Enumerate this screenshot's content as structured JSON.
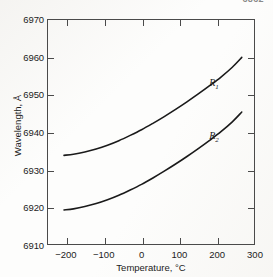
{
  "header": {
    "fragment_text": "6862"
  },
  "chart_data": {
    "type": "line",
    "title": "",
    "xlabel": "Temperature, °C",
    "ylabel": "Wavelength, Å",
    "xlim": [
      -250,
      300
    ],
    "ylim": [
      6910,
      6970
    ],
    "xticks": [
      -200,
      -100,
      0,
      100,
      200,
      300
    ],
    "xtick_labels": [
      "−200",
      "−100",
      "0",
      "100",
      "200",
      "300"
    ],
    "yticks": [
      6910,
      6920,
      6930,
      6940,
      6950,
      6960,
      6970
    ],
    "ytick_labels": [
      "6910",
      "6920",
      "6930",
      "6940",
      "6950",
      "6960",
      "6970"
    ],
    "grid": false,
    "legend": "inline-labels",
    "series": [
      {
        "name": "R1",
        "label": "R",
        "subscript": "1",
        "color": "#1a1a1a",
        "label_x": 200,
        "label_y": 6953,
        "x": [
          -205,
          -180,
          -150,
          -120,
          -90,
          -60,
          -30,
          0,
          30,
          60,
          90,
          120,
          150,
          180,
          210,
          240,
          265
        ],
        "y": [
          6933.8,
          6934.1,
          6934.7,
          6935.5,
          6936.5,
          6937.7,
          6939.1,
          6940.6,
          6942.3,
          6944.1,
          6946.0,
          6948.0,
          6950.1,
          6952.3,
          6954.6,
          6957.2,
          6959.8
        ]
      },
      {
        "name": "R2",
        "label": "R",
        "subscript": "2",
        "color": "#1a1a1a",
        "label_x": 200,
        "label_y": 6939,
        "x": [
          -205,
          -180,
          -150,
          -120,
          -90,
          -60,
          -30,
          0,
          30,
          60,
          90,
          120,
          150,
          180,
          210,
          240,
          265
        ],
        "y": [
          6919.3,
          6919.6,
          6920.2,
          6921.0,
          6922.0,
          6923.2,
          6924.6,
          6926.1,
          6927.8,
          6929.6,
          6931.5,
          6933.5,
          6935.6,
          6937.8,
          6940.1,
          6942.7,
          6945.3
        ]
      }
    ]
  }
}
